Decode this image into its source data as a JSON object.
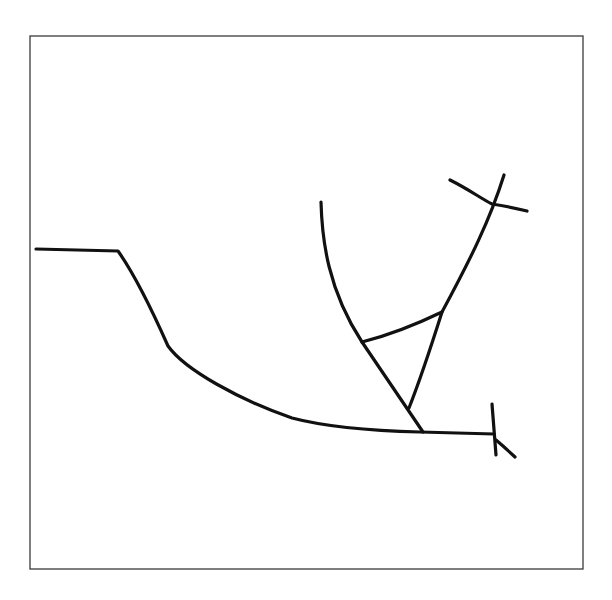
{
  "figure": {
    "width": 612,
    "height": 600,
    "background": "#ffffff",
    "frame": {
      "x": 30,
      "y": 36,
      "width": 553,
      "height": 533,
      "color": "#3a3a3a"
    },
    "line_color": "#111111",
    "line_width": 3.2,
    "strokes": [
      {
        "name": "left-profile-curve",
        "d": "M 36 249 L 118 251 C 135 275 152 310 168 346 C 185 370 240 400 292 418 C 330 428 380 431 420 432 L 494 434"
      },
      {
        "name": "inner-arc-left",
        "d": "M 321 202 C 322 240 328 290 362 342 L 423 432"
      },
      {
        "name": "outer-arc-right",
        "d": "M 504 175 C 490 220 470 260 442 312 C 430 350 420 380 409 408"
      },
      {
        "name": "triangle-top-edge",
        "d": "M 362 342 C 390 335 415 325 442 312"
      },
      {
        "name": "cross-bar",
        "d": "M 450 180 C 470 190 480 198 492 204 C 505 206 515 208 527 211"
      },
      {
        "name": "end-tick-vertical",
        "d": "M 492 404 L 496 455"
      },
      {
        "name": "end-tick-hook",
        "d": "M 496 440 L 503 446 L 515 457"
      }
    ]
  }
}
